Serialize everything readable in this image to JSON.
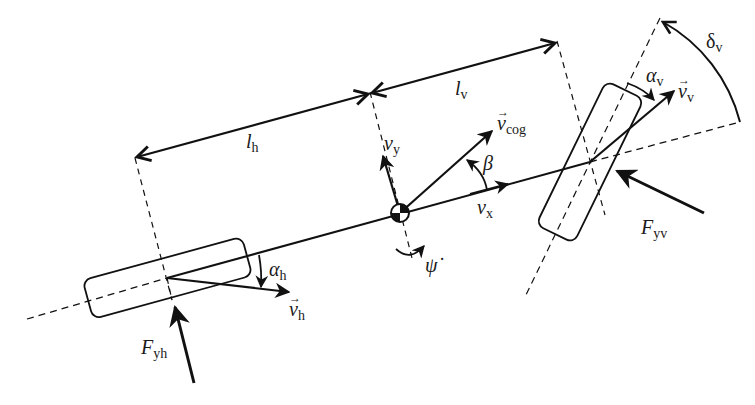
{
  "figure": {
    "colors": {
      "stroke": "#111111",
      "text": "#1a1a1a",
      "background": "#ffffff"
    }
  },
  "labels": {
    "l_h": {
      "main": "l",
      "sub": "h"
    },
    "l_v": {
      "main": "l",
      "sub": "v"
    },
    "v_cog": {
      "main": "v",
      "sub": "cog",
      "vector": "⃗"
    },
    "v_y": {
      "main": "v",
      "sub": "y"
    },
    "v_x": {
      "main": "v",
      "sub": "x"
    },
    "beta": {
      "main": "β"
    },
    "psi_dot": {
      "main": "ψ̇"
    },
    "delta_v": {
      "main": "δ",
      "sub": "v"
    },
    "alpha_v": {
      "main": "α",
      "sub": "v"
    },
    "alpha_h": {
      "main": "α",
      "sub": "h"
    },
    "v_v": {
      "main": "v",
      "sub": "v",
      "vector": "⃗"
    },
    "v_h": {
      "main": "v",
      "sub": "h",
      "vector": "⃗"
    },
    "F_yv": {
      "main": "F",
      "sub": "yv"
    },
    "F_yh": {
      "main": "F",
      "sub": "yh"
    }
  },
  "elements": {
    "center_of_gravity": "cog-marker",
    "rear_wheel": "rear-wheel",
    "front_wheel": "front-wheel",
    "vehicle_axis": "longitudinal-axis"
  }
}
